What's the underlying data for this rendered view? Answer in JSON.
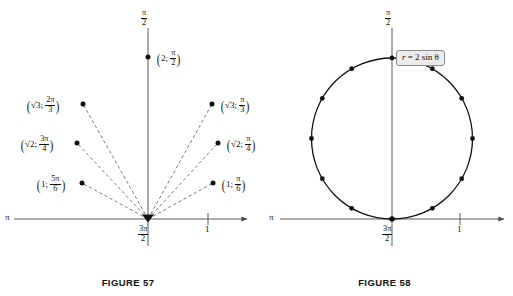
{
  "page": {
    "background_color": "#ffffff",
    "ink_color": "#111111",
    "axis_color": "#5a5a5a"
  },
  "figure57": {
    "caption": "FIGURE 57",
    "axis_labels": {
      "top": {
        "num": "π",
        "den": "2"
      },
      "bottom": {
        "num": "3π",
        "den": "2"
      },
      "left": "π",
      "tick_right": "1"
    },
    "points": [
      {
        "id": "point-2-pi-over-2",
        "r": "2",
        "theta_num": "π",
        "theta_den": "2",
        "radius_value": 2,
        "theta_degrees": 90,
        "label_side": "right",
        "has_ray": false
      },
      {
        "id": "point-sqrt3-2pi-over-3",
        "r": "√3",
        "theta_num": "2π",
        "theta_den": "3",
        "radius_value": 1.732,
        "theta_degrees": 120,
        "label_side": "left",
        "has_ray": true
      },
      {
        "id": "point-sqrt2-3pi-over-4",
        "r": "√2",
        "theta_num": "3π",
        "theta_den": "4",
        "radius_value": 1.414,
        "theta_degrees": 135,
        "label_side": "left",
        "has_ray": true
      },
      {
        "id": "point-1-5pi-over-6",
        "r": "1",
        "theta_num": "5π",
        "theta_den": "6",
        "radius_value": 1,
        "theta_degrees": 150,
        "label_side": "left",
        "has_ray": true
      },
      {
        "id": "point-sqrt3-pi-over-3",
        "r": "√3",
        "theta_num": "π",
        "theta_den": "3",
        "radius_value": 1.732,
        "theta_degrees": 60,
        "label_side": "right",
        "has_ray": true
      },
      {
        "id": "point-sqrt2-pi-over-4",
        "r": "√2",
        "theta_num": "π",
        "theta_den": "4",
        "radius_value": 1.414,
        "theta_degrees": 45,
        "label_side": "right",
        "has_ray": true
      },
      {
        "id": "point-1-pi-over-6",
        "r": "1",
        "theta_num": "π",
        "theta_den": "6",
        "radius_value": 1,
        "theta_degrees": 30,
        "label_side": "right",
        "has_ray": true
      }
    ]
  },
  "figure58": {
    "caption": "FIGURE 58",
    "equation": "r = 2 sin θ",
    "equation_parts": {
      "lhs": "r",
      "rel": "=",
      "rhs": "2 sin θ"
    },
    "axis_labels": {
      "top": {
        "num": "π",
        "den": "2"
      },
      "bottom": {
        "num": "3π",
        "den": "2"
      },
      "left": "π",
      "tick_right": "1"
    },
    "curve": {
      "type": "polar-circle",
      "equation": "r = 2 sin θ",
      "center_polar_y": 1,
      "radius": 1,
      "plotted_thetas": [
        0,
        30,
        60,
        90,
        120,
        150,
        180,
        210,
        240,
        270,
        300,
        330
      ]
    }
  }
}
